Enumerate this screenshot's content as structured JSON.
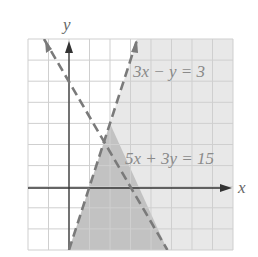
{
  "figure": {
    "x_axis_label": "x",
    "y_axis_label": "y",
    "x_range": [
      -2,
      8
    ],
    "y_range": [
      -3,
      7
    ],
    "grid": true,
    "grid_step": 1,
    "lines": [
      {
        "equation_label": "3x − y = 3",
        "a": 3,
        "b": -1,
        "c": 3,
        "style": "dashed"
      },
      {
        "equation_label": "5x + 3y = 15",
        "a": 5,
        "b": 3,
        "c": 15,
        "style": "dashed"
      }
    ],
    "regions": {
      "light_shade": "3x - y > 3",
      "dark_shade": "3x - y > 3 and 5x + 3y < 15"
    },
    "colors": {
      "background": "#ffffff",
      "grid": "#d0d0d0",
      "light_region": "#e8e8e8",
      "dark_region": "#c2c2c2",
      "dashed_line": "#7a7a7a",
      "axis": "#333333",
      "label_text": "#8a8a8a"
    }
  }
}
